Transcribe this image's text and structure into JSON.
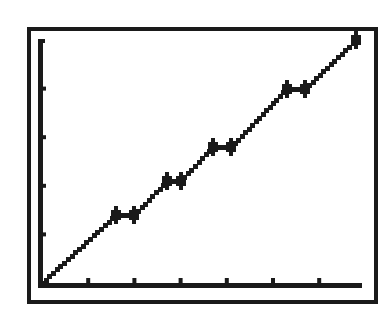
{
  "colors": {
    "background": "#ffffff",
    "ink": "#1a1a1a"
  },
  "screen": {
    "description": "Graphing calculator plot window"
  },
  "chart_data": {
    "type": "line",
    "title": "",
    "xlabel": "",
    "ylabel": "",
    "grid": false,
    "legend": null,
    "xlim": [
      0,
      7
    ],
    "ylim": [
      0,
      5
    ],
    "x_ticks": [
      0,
      1,
      2,
      3,
      4,
      5,
      6,
      7
    ],
    "y_ticks": [
      0,
      1,
      2,
      3,
      4,
      5
    ],
    "series": [
      {
        "name": "piecewise line with plateaus",
        "x": [
          0,
          1.6,
          2.0,
          2.7,
          3.0,
          3.7,
          4.1,
          5.3,
          5.7,
          6.8
        ],
        "y": [
          0,
          1.4,
          1.4,
          2.1,
          2.1,
          2.8,
          2.8,
          4.0,
          4.0,
          5.0
        ]
      }
    ],
    "markers": [
      {
        "x": 1.6,
        "y": 1.4
      },
      {
        "x": 2.0,
        "y": 1.4
      },
      {
        "x": 2.7,
        "y": 2.1
      },
      {
        "x": 3.0,
        "y": 2.1
      },
      {
        "x": 3.7,
        "y": 2.8
      },
      {
        "x": 4.1,
        "y": 2.8
      },
      {
        "x": 5.3,
        "y": 4.0
      },
      {
        "x": 5.7,
        "y": 4.0
      },
      {
        "x": 6.8,
        "y": 5.0
      }
    ]
  }
}
